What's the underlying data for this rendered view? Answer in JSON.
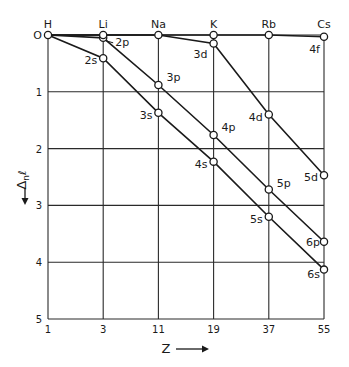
{
  "chart_data": {
    "type": "line",
    "title": "",
    "xlabel": "Z",
    "ylabel": "Δnl",
    "x_categories": [
      "1",
      "3",
      "11",
      "19",
      "37",
      "55"
    ],
    "x_top_labels": [
      "H",
      "Li",
      "Na",
      "K",
      "Rb",
      "Cs"
    ],
    "y_ticks": [
      "0",
      "1",
      "2",
      "3",
      "4",
      "5"
    ],
    "ylim": [
      0,
      5
    ],
    "y_inverted": true,
    "grid": true,
    "legend": "none (series labeled inline)",
    "series": [
      {
        "name": "s",
        "points": [
          {
            "x": "1",
            "y": 0,
            "label": ""
          },
          {
            "x": "3",
            "y": 0.41,
            "label": "2s"
          },
          {
            "x": "11",
            "y": 1.37,
            "label": "3s"
          },
          {
            "x": "19",
            "y": 2.23,
            "label": "4s"
          },
          {
            "x": "37",
            "y": 3.2,
            "label": "5s"
          },
          {
            "x": "55",
            "y": 4.13,
            "label": "6s"
          }
        ]
      },
      {
        "name": "p",
        "points": [
          {
            "x": "1",
            "y": 0,
            "label": ""
          },
          {
            "x": "3",
            "y": 0.05,
            "label": "2p"
          },
          {
            "x": "11",
            "y": 0.88,
            "label": "3p"
          },
          {
            "x": "19",
            "y": 1.76,
            "label": "4p"
          },
          {
            "x": "37",
            "y": 2.72,
            "label": "5p"
          },
          {
            "x": "55",
            "y": 3.64,
            "label": "6p"
          }
        ]
      },
      {
        "name": "d",
        "points": [
          {
            "x": "1",
            "y": 0,
            "label": ""
          },
          {
            "x": "3",
            "y": 0,
            "label": ""
          },
          {
            "x": "11",
            "y": 0,
            "label": ""
          },
          {
            "x": "19",
            "y": 0.15,
            "label": "3d"
          },
          {
            "x": "37",
            "y": 1.4,
            "label": "4d"
          },
          {
            "x": "55",
            "y": 2.47,
            "label": "5d"
          }
        ]
      },
      {
        "name": "f",
        "points": [
          {
            "x": "1",
            "y": 0,
            "label": ""
          },
          {
            "x": "3",
            "y": 0,
            "label": ""
          },
          {
            "x": "11",
            "y": 0,
            "label": ""
          },
          {
            "x": "19",
            "y": 0,
            "label": ""
          },
          {
            "x": "37",
            "y": 0,
            "label": ""
          },
          {
            "x": "55",
            "y": 0.03,
            "label": "4f"
          }
        ]
      }
    ]
  },
  "labels": {
    "xlabel": "Z",
    "ylabel_main": "Δ",
    "ylabel_sub": "n",
    "ylabel_l": "ℓ",
    "x_arrow": "⟶",
    "y_arrow": "↓"
  }
}
